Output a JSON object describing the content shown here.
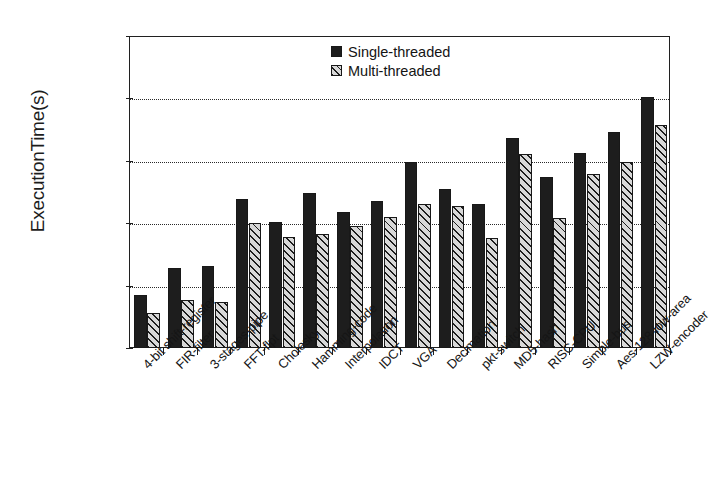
{
  "chart_data": {
    "type": "bar",
    "title": "",
    "subtitle": "",
    "xlabel": "",
    "ylabel": "ExecutionTime(s)",
    "yscale": "log",
    "ylim": [
      1,
      100000
    ],
    "ytick_labels": [
      "100000",
      "10000",
      "1000",
      "100",
      "10",
      "1"
    ],
    "ytick_values": [
      100000,
      10000,
      1000,
      100,
      10,
      1
    ],
    "grid": "horizontal-dotted",
    "legend_position": "top-center",
    "categories": [
      "4-bit shift-register",
      "FIR-filter",
      "3-stages-pipe",
      "FFT-flpt",
      "Cholesky",
      "Hamming-code",
      "Interpolation",
      "IDCT",
      "VGA",
      "Decimation",
      "pkt-switch",
      "MD5-hash",
      "RISC-CPU",
      "Simple-bus",
      "Aes-128-low-area",
      "LZW-encoder"
    ],
    "series": [
      {
        "name": "Single-threaded",
        "color": "#1d1d1d",
        "fill": "solid",
        "values": [
          7,
          19,
          21,
          240,
          105,
          300,
          150,
          230,
          950,
          350,
          205,
          2300,
          560,
          1350,
          2900,
          10500
        ]
      },
      {
        "name": "Multi-threaded",
        "color": "#d8d8d8",
        "fill": "diagonal-hatch",
        "values": [
          3.6,
          5.8,
          5.5,
          100,
          60,
          67,
          90,
          125,
          200,
          190,
          57,
          1300,
          120,
          620,
          950,
          3800
        ]
      }
    ]
  },
  "legend": {
    "entries": [
      {
        "label": "Single-threaded"
      },
      {
        "label": "Multi-threaded"
      }
    ]
  }
}
